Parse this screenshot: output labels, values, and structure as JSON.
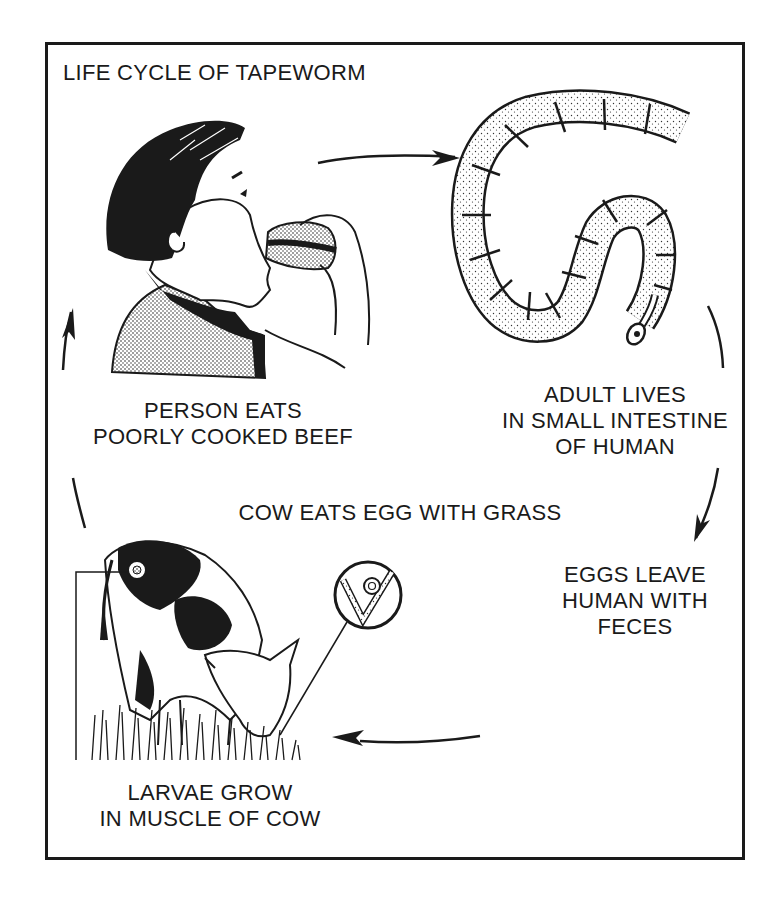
{
  "diagram": {
    "title": "LIFE CYCLE OF TAPEWORM",
    "stages": [
      {
        "id": "person-eats",
        "lines": [
          "PERSON EATS",
          "POORLY COOKED BEEF"
        ],
        "illustration": "boy-eating-sandwich"
      },
      {
        "id": "adult-lives",
        "lines": [
          "ADULT LIVES",
          "IN SMALL INTESTINE",
          "OF HUMAN"
        ],
        "illustration": "segmented-tapeworm"
      },
      {
        "id": "eggs-leave",
        "lines": [
          "EGGS LEAVE",
          "HUMAN WITH",
          "FECES"
        ],
        "illustration": null
      },
      {
        "id": "larvae-grow",
        "lines": [
          "LARVAE GROW",
          "IN MUSCLE OF COW"
        ],
        "illustration": "cow-grazing-with-cyst-inset"
      }
    ],
    "center_label": "COW EATS EGG WITH GRASS",
    "cycle_arrows": [
      {
        "from": "person-eats",
        "to": "adult-lives",
        "direction": "right"
      },
      {
        "from": "adult-lives",
        "to": "eggs-leave",
        "direction": "down"
      },
      {
        "from": "eggs-leave",
        "to": "larvae-grow",
        "direction": "left"
      },
      {
        "from": "larvae-grow",
        "to": "person-eats",
        "direction": "up"
      }
    ],
    "colors": {
      "ink": "#1a1a1a",
      "paper": "#ffffff",
      "stipple": "#d9d9d9"
    }
  }
}
